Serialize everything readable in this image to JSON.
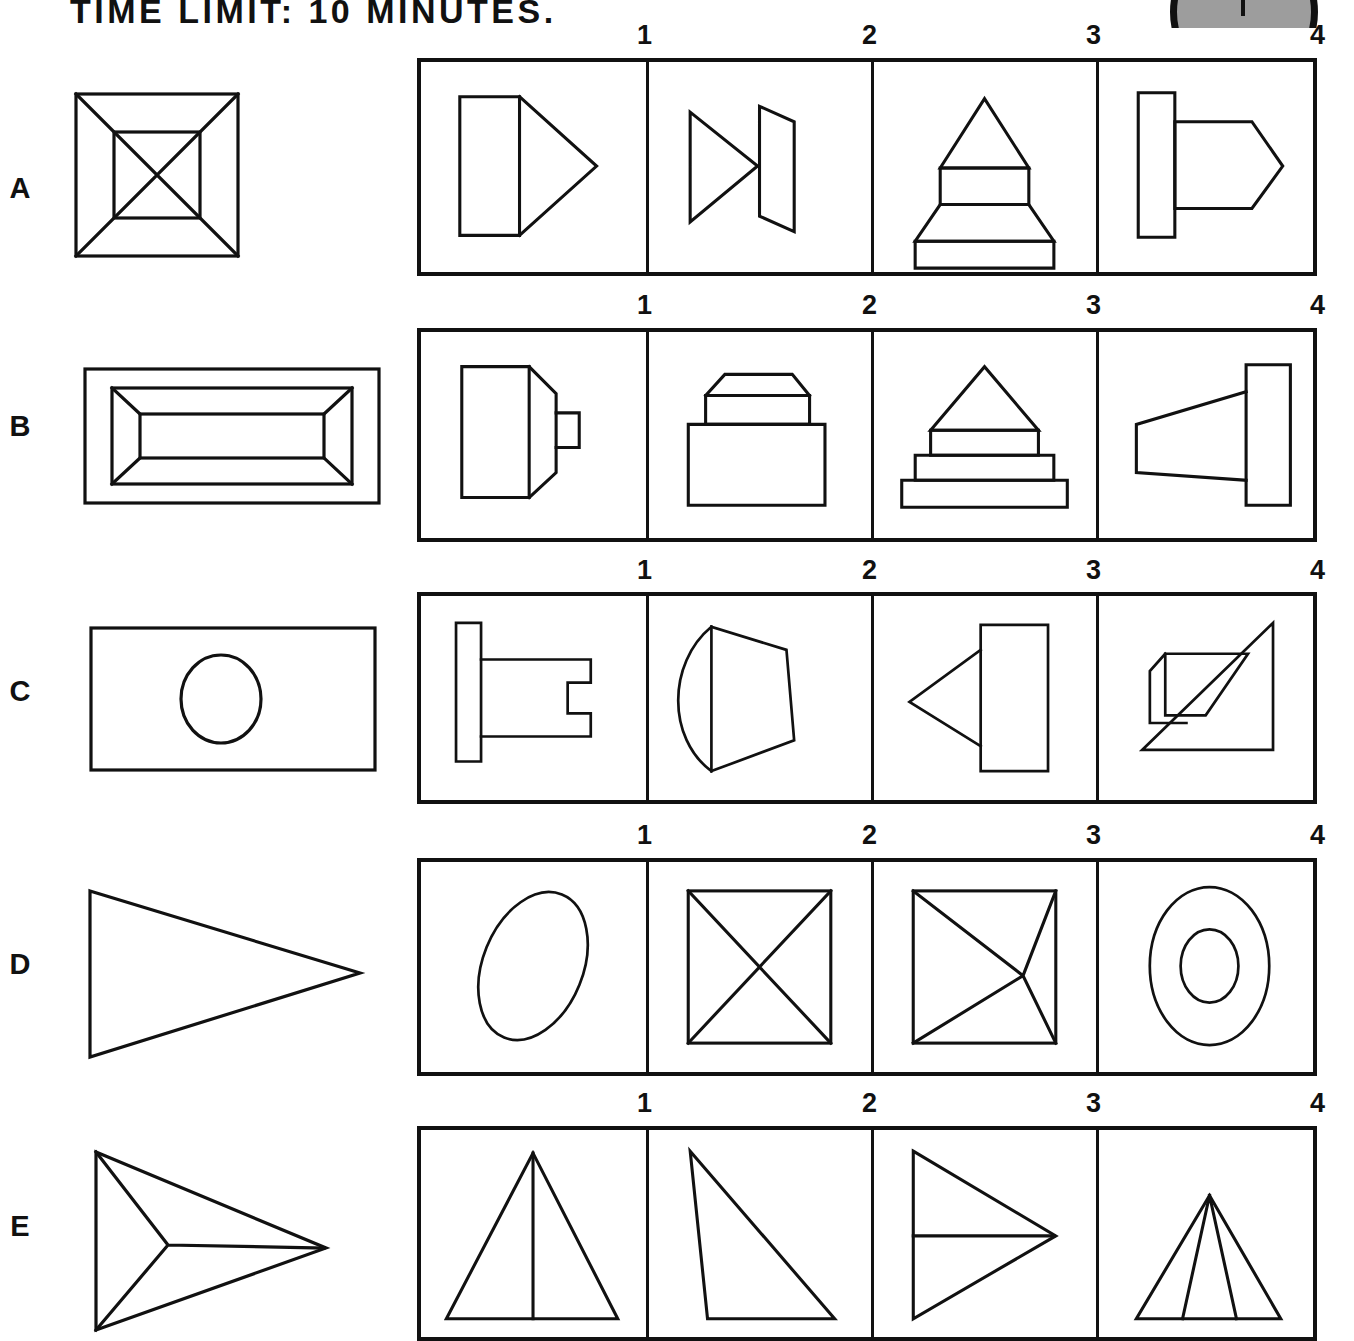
{
  "header": {
    "title": "TIME LIMIT: 10 MINUTES.",
    "logo_icon": "clock-face-icon"
  },
  "option_numbers": [
    "1",
    "2",
    "3",
    "4"
  ],
  "rows": [
    {
      "letter": "A",
      "stimulus_name": "square-with-inner-square-and-diagonals",
      "options": [
        {
          "number": "1",
          "name": "rectangle-with-right-triangle"
        },
        {
          "number": "2",
          "name": "triangle-meeting-trapezoid"
        },
        {
          "number": "3",
          "name": "stacked-tiers-with-peak"
        },
        {
          "number": "4",
          "name": "bar-with-pointed-block"
        }
      ]
    },
    {
      "letter": "B",
      "stimulus_name": "nested-rectangular-frustum",
      "options": [
        {
          "number": "1",
          "name": "block-with-tapered-end-and-stub"
        },
        {
          "number": "2",
          "name": "base-block-with-bevelled-cap"
        },
        {
          "number": "3",
          "name": "stepped-base-with-triangular-top"
        },
        {
          "number": "4",
          "name": "tapered-cone-into-bar"
        }
      ]
    },
    {
      "letter": "C",
      "stimulus_name": "rectangle-with-centered-circle",
      "options": [
        {
          "number": "1",
          "name": "bar-with-slotted-shaft"
        },
        {
          "number": "2",
          "name": "domed-tapered-block"
        },
        {
          "number": "3",
          "name": "rectangle-with-left-cone"
        },
        {
          "number": "4",
          "name": "triangle-with-overlapping-flap"
        }
      ]
    },
    {
      "letter": "D",
      "stimulus_name": "large-right-pointing-triangle",
      "options": [
        {
          "number": "1",
          "name": "tilted-ellipse"
        },
        {
          "number": "2",
          "name": "rectangle-with-crossed-diagonals"
        },
        {
          "number": "3",
          "name": "rectangle-with-y-junction-lines"
        },
        {
          "number": "4",
          "name": "concentric-ellipses"
        }
      ]
    },
    {
      "letter": "E",
      "stimulus_name": "three-pointed-star-arrow",
      "options": [
        {
          "number": "1",
          "name": "isosceles-triangle-with-median"
        },
        {
          "number": "2",
          "name": "right-triangle-leaning-right"
        },
        {
          "number": "3",
          "name": "right-pointing-triangle-with-horizontal"
        },
        {
          "number": "4",
          "name": "triangle-with-two-inner-lines"
        }
      ]
    }
  ],
  "colors": {
    "ink": "#111111",
    "paper": "#ffffff",
    "logo_fill": "#9d9d9d"
  }
}
